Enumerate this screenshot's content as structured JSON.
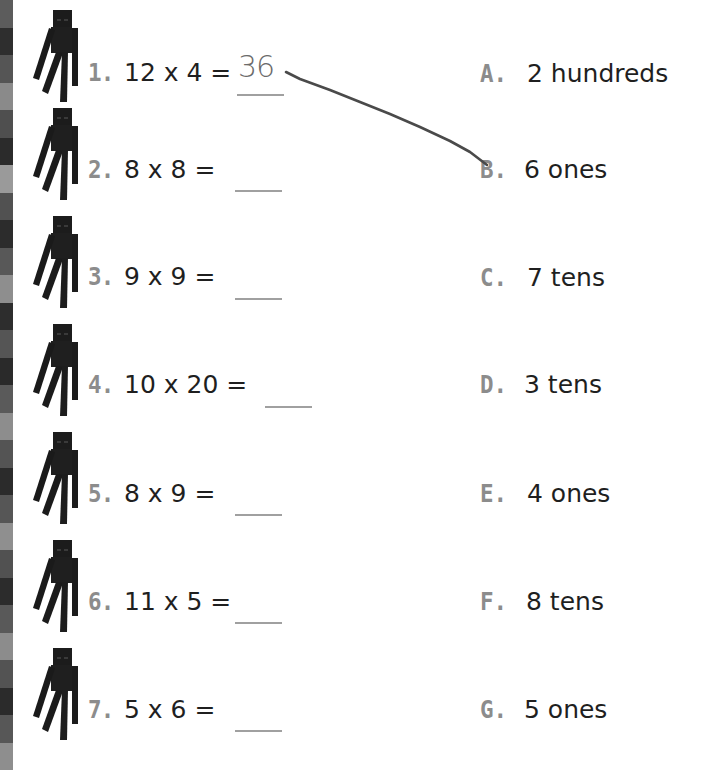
{
  "worksheet": {
    "problems": [
      {
        "number": "1.",
        "equation": "12 x 4 =",
        "answer": "36"
      },
      {
        "number": "2.",
        "equation": "8 x 8 =",
        "answer": ""
      },
      {
        "number": "3.",
        "equation": "9 x 9 =",
        "answer": ""
      },
      {
        "number": "4.",
        "equation": "10 x 20 =",
        "answer": ""
      },
      {
        "number": "5.",
        "equation": "8 x 9 =",
        "answer": ""
      },
      {
        "number": "6.",
        "equation": "11 x 5 =",
        "answer": ""
      },
      {
        "number": "7.",
        "equation": "5 x 6 =",
        "answer": ""
      }
    ],
    "choices": [
      {
        "letter": "A.",
        "text": "2 hundreds"
      },
      {
        "letter": "B.",
        "text": "6 ones"
      },
      {
        "letter": "C.",
        "text": "7 tens"
      },
      {
        "letter": "D.",
        "text": "3 tens"
      },
      {
        "letter": "E.",
        "text": "4 ones"
      },
      {
        "letter": "F.",
        "text": "8 tens"
      },
      {
        "letter": "G.",
        "text": "5 ones"
      }
    ],
    "connections": [
      {
        "from_problem": "1.",
        "to_choice": "B."
      }
    ],
    "icon": "enderman-icon"
  },
  "colors": {
    "label_gray": "#8c8c8c",
    "text": "#1f1f1f",
    "answer_line": "#a0a0a0",
    "handwriting": "#6b6b6b",
    "connector": "#4a4a4a"
  }
}
